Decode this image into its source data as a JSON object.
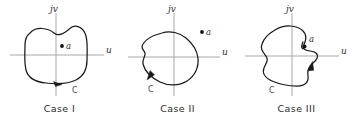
{
  "figure": {
    "background_color": "#ffffff",
    "contour_color": "#1a1a1a",
    "axis_color": "#a8a8a8",
    "label_color": "#333333"
  },
  "panels": [
    {
      "id": "case-1",
      "caption": "Case I",
      "axis_vertical_label": "jv",
      "axis_horizontal_label": "u",
      "point_label": "a",
      "contour_label": "C",
      "point_inside_contour": true,
      "arrow_direction": "clockwise",
      "description": "Point a lies inside the closed contour C"
    },
    {
      "id": "case-2",
      "caption": "Case II",
      "axis_vertical_label": "jv",
      "axis_horizontal_label": "u",
      "point_label": "a",
      "contour_label": "C",
      "point_inside_contour": false,
      "arrow_direction": "clockwise",
      "description": "Point a lies outside the closed contour C"
    },
    {
      "id": "case-3",
      "caption": "Case III",
      "axis_vertical_label": "jv",
      "axis_horizontal_label": "u",
      "point_label": "a",
      "contour_label": "C",
      "point_inside_contour": false,
      "arrow_direction": "clockwise",
      "description": "Point a lies on the closed contour C with an indentation"
    }
  ]
}
